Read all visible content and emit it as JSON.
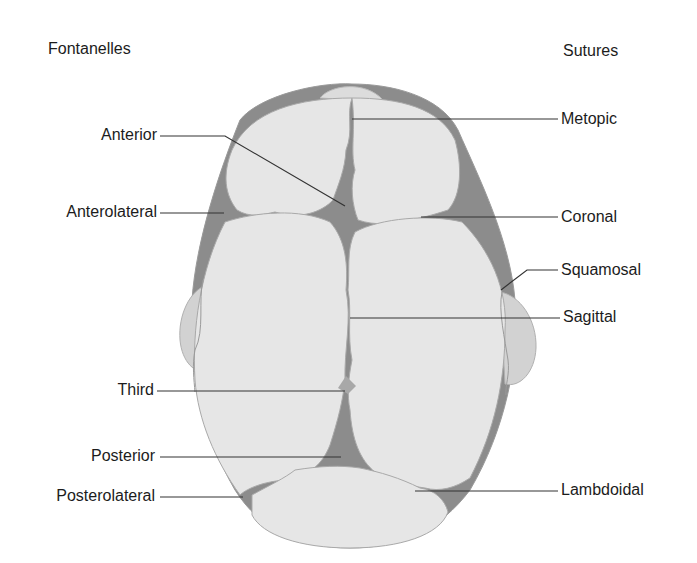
{
  "figure": {
    "headings": {
      "left": "Fontanelles",
      "right": "Sutures"
    },
    "fontanelles": [
      {
        "label": "Anterior"
      },
      {
        "label": "Anterolateral"
      },
      {
        "label": "Third"
      },
      {
        "label": "Posterior"
      },
      {
        "label": "Posterolateral"
      }
    ],
    "sutures": [
      {
        "label": "Metopic"
      },
      {
        "label": "Coronal"
      },
      {
        "label": "Squamosal"
      },
      {
        "label": "Sagittal"
      },
      {
        "label": "Lambdoidal"
      }
    ],
    "caption": "",
    "colors": {
      "bone": "#e6e6e6",
      "bone_edge": "#a9a9a9",
      "fontanelle": "#8c8c8c",
      "ear": "#d2d2d2",
      "leader_line": "#333333",
      "text": "#1c1c1c"
    }
  }
}
